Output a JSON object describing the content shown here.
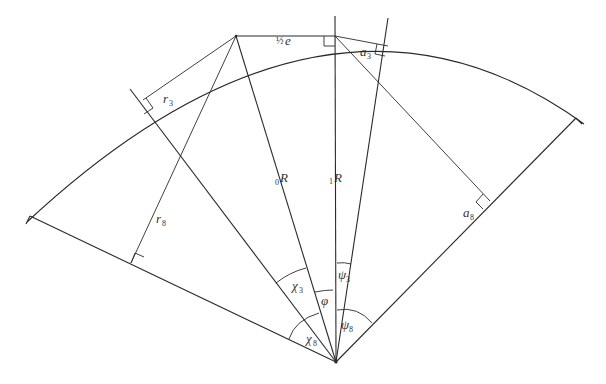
{
  "diagram": {
    "type": "geometric-sector-construction",
    "labels": {
      "half_e": {
        "frac": "½",
        "var": "e"
      },
      "a3": {
        "base": "a",
        "sub": "3"
      },
      "a8": {
        "base": "a",
        "sub": "8"
      },
      "r3": {
        "base": "r",
        "sub": "3"
      },
      "r8": {
        "base": "r",
        "sub": "8"
      },
      "R0": {
        "pre": "0",
        "base": "R"
      },
      "R1": {
        "pre": "1",
        "base": "R"
      },
      "chi3": {
        "base": "χ",
        "sub": "3"
      },
      "chi8": {
        "base": "χ",
        "sub": "8"
      },
      "phi": {
        "base": "φ"
      },
      "psi3": {
        "base": "ψ",
        "sub": "3"
      },
      "psi8": {
        "base": "ψ",
        "sub": "8"
      }
    },
    "colors": {
      "line": "#2a2a2a",
      "text": "#333333",
      "background": "#ffffff"
    }
  }
}
